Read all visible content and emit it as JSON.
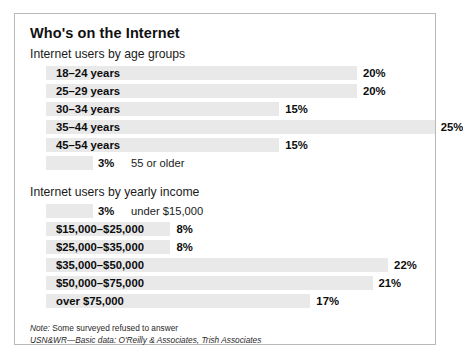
{
  "figure": {
    "title": "Who's on the Internet",
    "sections": [
      {
        "heading": "Internet users by age groups",
        "rows": [
          {
            "label": "18–24 years",
            "value": "20%",
            "pct": 20,
            "label_inside": true
          },
          {
            "label": "25–29 years",
            "value": "20%",
            "pct": 20,
            "label_inside": true
          },
          {
            "label": "30–34 years",
            "value": "15%",
            "pct": 15,
            "label_inside": true
          },
          {
            "label": "35–44 years",
            "value": "25%",
            "pct": 25,
            "label_inside": true
          },
          {
            "label": "45–54 years",
            "value": "15%",
            "pct": 15,
            "label_inside": true
          },
          {
            "label": "55 or older",
            "value": "3%",
            "pct": 3,
            "label_inside": false
          }
        ]
      },
      {
        "heading": "Internet users by yearly income",
        "rows": [
          {
            "label": "under $15,000",
            "value": "3%",
            "pct": 3,
            "label_inside": false
          },
          {
            "label": "$15,000–$25,000",
            "value": "8%",
            "pct": 8,
            "label_inside": true
          },
          {
            "label": "$25,000–$35,000",
            "value": "8%",
            "pct": 8,
            "label_inside": true
          },
          {
            "label": "$35,000–$50,000",
            "value": "22%",
            "pct": 22,
            "label_inside": true
          },
          {
            "label": "$50,000–$75,000",
            "value": "21%",
            "pct": 21,
            "label_inside": true
          },
          {
            "label": "over $75,000",
            "value": "17%",
            "pct": 17,
            "label_inside": true
          }
        ]
      }
    ],
    "notes": {
      "note_prefix": "Note:",
      "note_text": "Some surveyed refused to answer",
      "source_prefix": "USN&WR",
      "source_text": "—Basic data: O'Reilly & Associates, Trish Associates"
    },
    "colors": {
      "bar_fill": "#e9e9e9",
      "frame_border": "#b9b9b9",
      "text": "#0d0d0d",
      "background": "#ffffff"
    }
  },
  "chart_data": {
    "type": "bar",
    "title": "Who's on the Internet",
    "orientation": "horizontal",
    "xlabel": "",
    "ylabel": "",
    "xlim": [
      0,
      25
    ],
    "grid": false,
    "legend": "none",
    "units": "percent of Internet users",
    "groups": [
      {
        "name": "Internet users by age groups",
        "categories": [
          "18–24 years",
          "25–29 years",
          "30–34 years",
          "35–44 years",
          "45–54 years",
          "55 or older"
        ],
        "values": [
          20,
          20,
          15,
          25,
          15,
          3
        ],
        "value_labels": [
          "20%",
          "20%",
          "15%",
          "25%",
          "15%",
          "3%"
        ]
      },
      {
        "name": "Internet users by yearly income",
        "categories": [
          "under $15,000",
          "$15,000–$25,000",
          "$25,000–$35,000",
          "$35,000–$50,000",
          "$50,000–$75,000",
          "over $75,000"
        ],
        "values": [
          3,
          8,
          8,
          22,
          21,
          17
        ],
        "value_labels": [
          "3%",
          "8%",
          "8%",
          "22%",
          "21%",
          "17%"
        ]
      }
    ],
    "annotations": [
      "Note: Some surveyed refused to answer",
      "USN&WR—Basic data: O'Reilly & Associates, Trish Associates"
    ]
  }
}
